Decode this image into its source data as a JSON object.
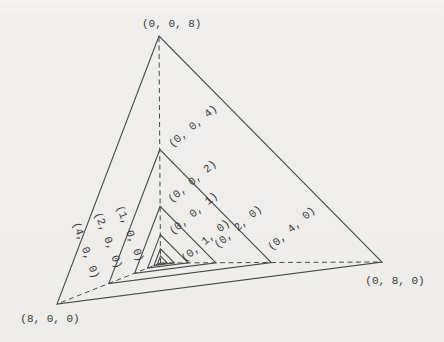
{
  "figure": {
    "labels": {
      "v008": "(0, 0, 8)",
      "v004": "(0, 0, 4)",
      "v002": "(0, 0, 2)",
      "v001": "(0, 0, 1)",
      "v010": "(0, 1, 0)",
      "v020": "(0, 2, 0)",
      "v040": "(0, 4, 0)",
      "v080": "(0, 8, 0)",
      "v100": "(1, 0, 0)",
      "v200": "(2, 0, 0)",
      "v400": "(4, 0, 0)",
      "v800": "(8, 0, 0)"
    },
    "colors": {
      "background": "#efeeec",
      "line": "#4a4a4a",
      "text": "#383838"
    }
  }
}
